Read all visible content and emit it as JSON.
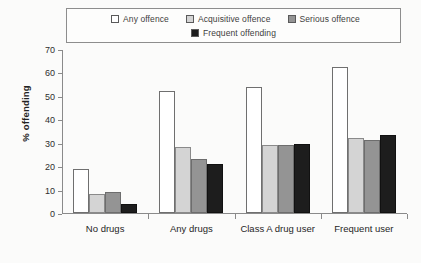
{
  "chart_data": {
    "type": "bar",
    "title": "",
    "xlabel": "",
    "ylabel": "% offending",
    "ylim": [
      0,
      70
    ],
    "yticks": [
      0,
      10,
      20,
      30,
      40,
      50,
      60,
      70
    ],
    "grid": false,
    "legend_position": "top",
    "categories": [
      "No drugs",
      "Any drugs",
      "Class A drug user",
      "Frequent user"
    ],
    "series": [
      {
        "name": "Any offence",
        "color": "#ffffff",
        "values": [
          19,
          52,
          54,
          62.5
        ]
      },
      {
        "name": "Acquisitive offence",
        "color": "#d4d4d4",
        "values": [
          8,
          28,
          29,
          32
        ]
      },
      {
        "name": "Serious offence",
        "color": "#949494",
        "values": [
          9,
          23,
          29,
          31
        ]
      },
      {
        "name": "Frequent offending",
        "color": "#1d1d1d",
        "values": [
          4,
          21,
          29.5,
          33.5
        ]
      }
    ]
  },
  "legend": {
    "row1": [
      {
        "label": "Any offence",
        "swatch": "legend-swatch-any-offence"
      },
      {
        "label": "Acquisitive offence",
        "swatch": "legend-swatch-acquisitive-offence"
      },
      {
        "label": "Serious offence",
        "swatch": "legend-swatch-serious-offence"
      }
    ],
    "row2": [
      {
        "label": "Frequent offending",
        "swatch": "legend-swatch-frequent-offending"
      }
    ]
  }
}
